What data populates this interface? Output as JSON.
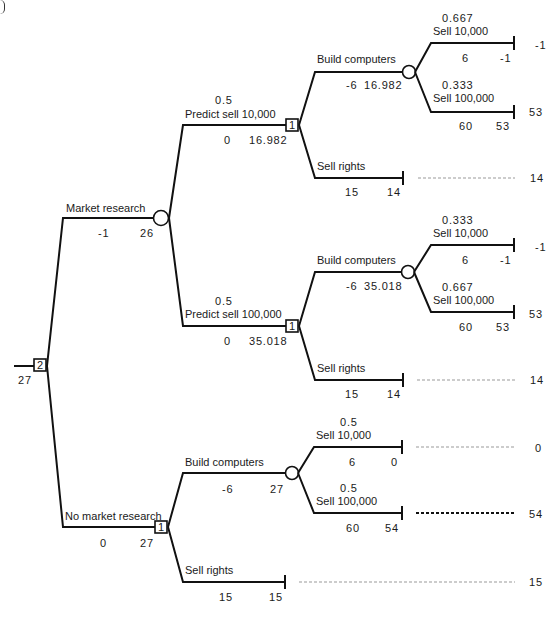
{
  "root": {
    "id": "2",
    "value": "27"
  },
  "market_research": {
    "label": "Market research",
    "cost": "-1",
    "value": "26",
    "predict_low": {
      "prob": "0.5",
      "label": "Predict sell 10,000",
      "cost": "0",
      "value": "16.982",
      "decision_id": "1",
      "build": {
        "label": "Build computers",
        "cost": "-6",
        "value": "16.982",
        "low": {
          "prob": "0.667",
          "label": "Sell 10,000",
          "payoff": "6",
          "value": "-1",
          "terminal": "-1"
        },
        "high": {
          "prob": "0.333",
          "label": "Sell 100,000",
          "payoff": "60",
          "value": "53",
          "terminal": "53"
        }
      },
      "sell_rights": {
        "label": "Sell rights",
        "payoff": "15",
        "value": "14",
        "terminal": "14"
      }
    },
    "predict_high": {
      "prob": "0.5",
      "label": "Predict sell 100,000",
      "cost": "0",
      "value": "35.018",
      "decision_id": "1",
      "build": {
        "label": "Build computers",
        "cost": "-6",
        "value": "35.018",
        "low": {
          "prob": "0.333",
          "label": "Sell 10,000",
          "payoff": "6",
          "value": "-1",
          "terminal": "-1"
        },
        "high": {
          "prob": "0.667",
          "label": "Sell 100,000",
          "payoff": "60",
          "value": "53",
          "terminal": "53"
        }
      },
      "sell_rights": {
        "label": "Sell rights",
        "payoff": "15",
        "value": "14",
        "terminal": "14"
      }
    }
  },
  "no_market_research": {
    "label": "No market research",
    "cost": "0",
    "value": "27",
    "decision_id": "1",
    "build": {
      "label": "Build computers",
      "cost": "-6",
      "value": "27",
      "low": {
        "prob": "0.5",
        "label": "Sell 10,000",
        "payoff": "6",
        "value": "0",
        "terminal": "0"
      },
      "high": {
        "prob": "0.5",
        "label": "Sell 100,000",
        "payoff": "60",
        "value": "54",
        "terminal": "54"
      }
    },
    "sell_rights": {
      "label": "Sell rights",
      "payoff": "15",
      "value": "15",
      "terminal": "15"
    }
  }
}
